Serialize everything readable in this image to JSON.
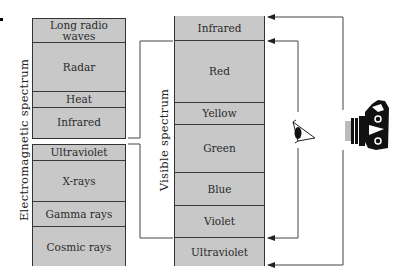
{
  "diagram": {
    "electromagnetic": {
      "label": "Electromagnetic spectrum",
      "upper_group": [
        "Long radio waves",
        "Radar",
        "Heat",
        "Infrared"
      ],
      "lower_group": [
        "Ultraviolet",
        "X-rays",
        "Gamma rays",
        "Cosmic rays"
      ]
    },
    "visible": {
      "label": "Visible spectrum",
      "bands": [
        "Infrared",
        "Red",
        "Yellow",
        "Green",
        "Blue",
        "Violet",
        "Ultraviolet"
      ]
    },
    "detectors": [
      {
        "name": "eye-icon",
        "range": "Red to Violet"
      },
      {
        "name": "camera-icon",
        "range": "Infrared to Ultraviolet"
      }
    ],
    "colors": {
      "band_fill": "#c8c8c8",
      "line": "#333333"
    }
  }
}
